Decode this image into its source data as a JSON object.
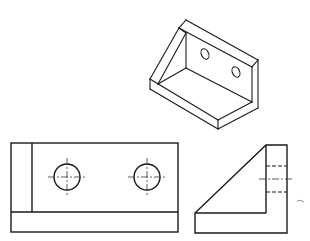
{
  "figure": {
    "title": "",
    "colors": {
      "line": "#1a1a1a",
      "background": "#ffffff",
      "centerline": "#333333"
    },
    "views": {
      "isometric": {
        "label": "",
        "hole_count": 2
      },
      "front": {
        "label": "",
        "hole_count": 2,
        "holes": [
          {
            "cx": 67,
            "cy": 177,
            "r": 13
          },
          {
            "cx": 147,
            "cy": 177,
            "r": 13
          }
        ]
      },
      "side": {
        "label": "",
        "hidden_line_count": 2
      }
    }
  }
}
